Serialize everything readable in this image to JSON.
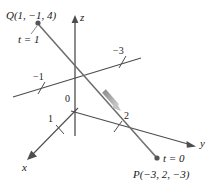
{
  "figure": {
    "colors": {
      "axis": "#4d4d4d",
      "line": "#6b6b6b",
      "vector_arrow": "#a0a0a0",
      "text": "#1a1a1a",
      "point": "#555555"
    },
    "axes": [
      {
        "name": "z-axis",
        "label": "z"
      },
      {
        "name": "y-axis",
        "label": "y"
      },
      {
        "name": "x-axis",
        "label": "x"
      },
      {
        "name": "negative-x-axis",
        "label": ""
      }
    ],
    "axis_labels": {
      "z": "z",
      "y": "y",
      "x": "x"
    },
    "tick_labels": {
      "neg_one": "−1",
      "origin": "0",
      "one": "1",
      "two": "2",
      "neg_three": "−3"
    },
    "points": [
      {
        "id": "Q",
        "label": "Q(1, −1, 4)",
        "parameter": "t = 1"
      },
      {
        "id": "P",
        "label": "P(−3, 2, −3)",
        "parameter": "t = 0"
      }
    ],
    "point_Q": {
      "label": "Q(1, −1, 4)",
      "parameter": "t = 1"
    },
    "point_P": {
      "label": "P(−3, 2, −3)",
      "parameter": "t = 0"
    }
  }
}
